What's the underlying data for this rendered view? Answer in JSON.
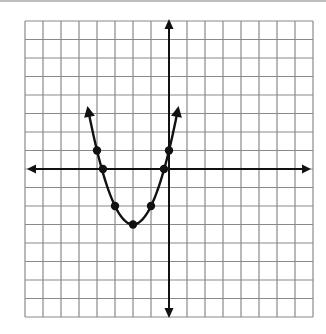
{
  "chart_data": {
    "type": "line",
    "title": "",
    "xlabel": "",
    "ylabel": "",
    "grid": true,
    "xlim": [
      -8,
      8
    ],
    "ylim": [
      -8,
      8
    ],
    "grid_step": 1,
    "axes_have_arrows": true,
    "tick_labels_shown": false,
    "series": [
      {
        "name": "parabola",
        "equation_derived_from_plotted_points": "y = (x + 2)^2 - 3",
        "vertex": [
          -2,
          -3
        ],
        "opens": "up",
        "curve_endpoint_arrows": true,
        "marked_points": [
          {
            "x": -4,
            "y": 1
          },
          {
            "x": -3.67,
            "y": 0,
            "note": "measured from image; fitted root -2 - sqrt(3) = -3.73"
          },
          {
            "x": -3,
            "y": -2
          },
          {
            "x": -2,
            "y": -3
          },
          {
            "x": -1,
            "y": -2
          },
          {
            "x": -0.28,
            "y": 0,
            "note": "measured from image; fitted root -2 + sqrt(3) = -0.27"
          },
          {
            "x": 0,
            "y": 1
          }
        ],
        "curve_x_range": [
          -4.5,
          0.5
        ]
      }
    ]
  },
  "colors": {
    "grid": "#8a8a8a",
    "axis": "#111111",
    "curve": "#111111",
    "point": "#111111",
    "background": "#ffffff"
  }
}
